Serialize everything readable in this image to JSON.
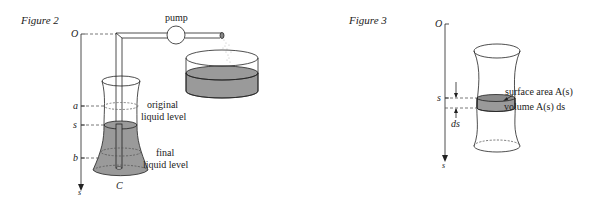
{
  "figure2": {
    "title": "Figure 2",
    "axis_origin": "O",
    "axis_var": "s",
    "level_labels": [
      "a",
      "s",
      "b"
    ],
    "pump_label": "pump",
    "original_level": [
      "original",
      "liquid level"
    ],
    "final_level": [
      "final",
      "liquid level"
    ],
    "bottom_label": "C"
  },
  "figure3": {
    "title": "Figure 3",
    "axis_origin": "O",
    "axis_var": "s",
    "level_label": "s",
    "ds_label": "ds",
    "surface_label": "surface area A(s)",
    "volume_label": "volume A(s) ds"
  },
  "colors": {
    "line": "#222222",
    "liquid": "#9a9a9a",
    "dash": "#555555"
  }
}
